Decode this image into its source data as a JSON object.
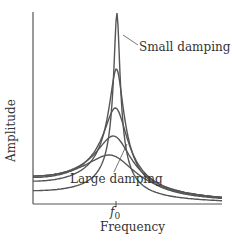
{
  "chart_data": {
    "type": "line",
    "title": "",
    "xlabel": "Frequency",
    "ylabel": "Amplitude",
    "x_ticks": [
      "f0"
    ],
    "grid": false,
    "legend": null,
    "annotations": [
      "Small damping",
      "Large damping"
    ],
    "series": [
      {
        "name": "Small damping",
        "peak_relative": 1.0
      },
      {
        "name": "damping 2",
        "peak_relative": 0.7
      },
      {
        "name": "damping 3",
        "peak_relative": 0.49
      },
      {
        "name": "damping 4",
        "peak_relative": 0.35
      },
      {
        "name": "Large damping",
        "peak_relative": 0.25
      }
    ]
  },
  "labels": {
    "ylabel": "Amplitude",
    "xlabel": "Frequency",
    "tick": "f",
    "tick_sub": "0",
    "small": "Small damping",
    "large": "Large damping"
  }
}
